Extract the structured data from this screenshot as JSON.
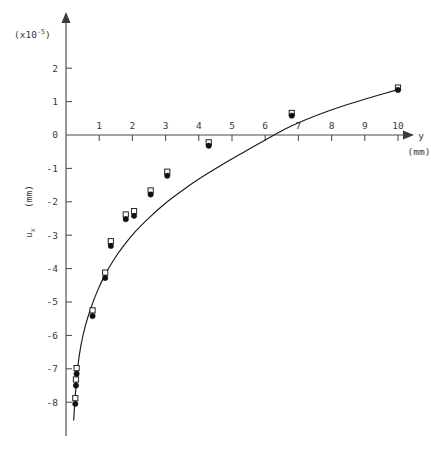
{
  "figure": {
    "scale_note": "(x10^-5)",
    "scale_note_base": "(x10",
    "scale_note_exp": "-5",
    "scale_note_close": ")",
    "y_axis_label": "u",
    "y_axis_label_sub": "x",
    "y_axis_units": "(mm)",
    "x_axis_label": "y",
    "x_axis_units": "(mm)"
  },
  "chart_data": {
    "type": "scatter",
    "title": "",
    "subtitle": "",
    "xlabel": "y (mm)",
    "ylabel": "u_x (mm)",
    "y_scale_factor": "x10^-5",
    "xlim": [
      0,
      10.6
    ],
    "ylim": [
      -8.6,
      2.6
    ],
    "grid": false,
    "legend": null,
    "x_ticks": [
      1,
      2,
      3,
      4,
      5,
      6,
      7,
      8,
      9,
      10
    ],
    "x_tick_labels": [
      "1",
      "2",
      "3",
      "4",
      "5",
      "6",
      "7",
      "8",
      "9",
      "10"
    ],
    "y_ticks": [
      2,
      1,
      0,
      -1,
      -2,
      -3,
      -4,
      -5,
      -6,
      -7,
      -8
    ],
    "y_tick_labels": [
      "2",
      "1",
      "0",
      "-1",
      "-2",
      "-3",
      "-4",
      "-5",
      "-6",
      "-7",
      "-8"
    ],
    "series": [
      {
        "name": "measured-circles",
        "marker": "filled-circle",
        "points": [
          {
            "x": 0.28,
            "y": -8.05
          },
          {
            "x": 0.3,
            "y": -7.5
          },
          {
            "x": 0.32,
            "y": -7.15
          },
          {
            "x": 0.8,
            "y": -5.42
          },
          {
            "x": 1.18,
            "y": -4.28
          },
          {
            "x": 1.35,
            "y": -3.32
          },
          {
            "x": 1.8,
            "y": -2.52
          },
          {
            "x": 2.05,
            "y": -2.42
          },
          {
            "x": 2.55,
            "y": -1.78
          },
          {
            "x": 3.05,
            "y": -1.22
          },
          {
            "x": 4.3,
            "y": -0.32
          },
          {
            "x": 6.8,
            "y": 0.58
          },
          {
            "x": 10.0,
            "y": 1.35
          }
        ]
      },
      {
        "name": "measured-squares",
        "marker": "open-square",
        "points": [
          {
            "x": 0.28,
            "y": -7.88
          },
          {
            "x": 0.3,
            "y": -7.32
          },
          {
            "x": 0.32,
            "y": -6.98
          },
          {
            "x": 0.8,
            "y": -5.25
          },
          {
            "x": 1.18,
            "y": -4.12
          },
          {
            "x": 1.35,
            "y": -3.18
          },
          {
            "x": 1.8,
            "y": -2.38
          },
          {
            "x": 2.05,
            "y": -2.28
          },
          {
            "x": 2.55,
            "y": -1.66
          },
          {
            "x": 3.05,
            "y": -1.1
          },
          {
            "x": 4.3,
            "y": -0.22
          },
          {
            "x": 6.8,
            "y": 0.66
          },
          {
            "x": 10.0,
            "y": 1.42
          }
        ]
      },
      {
        "name": "fitted-curve",
        "marker": "line",
        "points": [
          {
            "x": 0.23,
            "y": -8.55
          },
          {
            "x": 0.26,
            "y": -8.1
          },
          {
            "x": 0.3,
            "y": -7.55
          },
          {
            "x": 0.36,
            "y": -6.9
          },
          {
            "x": 0.45,
            "y": -6.3
          },
          {
            "x": 0.58,
            "y": -5.72
          },
          {
            "x": 0.75,
            "y": -5.18
          },
          {
            "x": 0.95,
            "y": -4.66
          },
          {
            "x": 1.18,
            "y": -4.18
          },
          {
            "x": 1.45,
            "y": -3.72
          },
          {
            "x": 1.75,
            "y": -3.3
          },
          {
            "x": 2.1,
            "y": -2.88
          },
          {
            "x": 2.5,
            "y": -2.48
          },
          {
            "x": 2.95,
            "y": -2.08
          },
          {
            "x": 3.45,
            "y": -1.7
          },
          {
            "x": 4.0,
            "y": -1.32
          },
          {
            "x": 4.6,
            "y": -0.95
          },
          {
            "x": 5.2,
            "y": -0.6
          },
          {
            "x": 5.52,
            "y": -0.42
          },
          {
            "x": 6.0,
            "y": -0.15
          },
          {
            "x": 6.6,
            "y": 0.18
          },
          {
            "x": 7.2,
            "y": 0.45
          },
          {
            "x": 7.9,
            "y": 0.72
          },
          {
            "x": 8.6,
            "y": 0.95
          },
          {
            "x": 9.3,
            "y": 1.16
          },
          {
            "x": 10.0,
            "y": 1.36
          }
        ]
      }
    ],
    "annotations": [
      {
        "text": "(x10^-5)",
        "position": "top-left-of-y-axis"
      },
      {
        "text": "(mm)",
        "position": "below-y-axis-arrow-label"
      }
    ]
  }
}
